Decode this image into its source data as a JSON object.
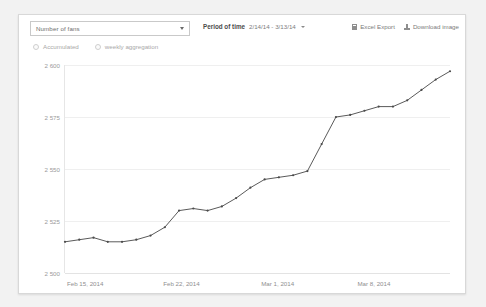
{
  "toolbar": {
    "metric_select": {
      "value": "Number of fans",
      "icon": "chevron-down-icon"
    },
    "period": {
      "label": "Period of time",
      "value": "2/14/14 - 3/13/14",
      "icon": "chevron-down-icon"
    },
    "excel_export": {
      "label": "Excel Export",
      "icon": "spreadsheet-icon"
    },
    "download_image": {
      "label": "Download image",
      "icon": "download-icon"
    }
  },
  "options": [
    {
      "label": "Accumulated",
      "selected": false,
      "icon": "radio-icon"
    },
    {
      "label": "weekly aggregation",
      "selected": false,
      "icon": "radio-icon"
    }
  ],
  "colors": {
    "line": "#5a5a5a",
    "marker": "#4a4a4a",
    "grid": "#efefef",
    "axis": "#e3e3e3",
    "card_bg": "#ffffff",
    "page_bg": "#f2f2f2",
    "text_muted": "#9a9a9a"
  },
  "chart_data": {
    "type": "line",
    "title": "",
    "xlabel": "",
    "ylabel": "",
    "grid": true,
    "legend": "none",
    "ylim": [
      2500,
      2600
    ],
    "yticks": [
      2500,
      2525,
      2550,
      2575,
      2600
    ],
    "ytick_labels": [
      "2 500",
      "2 525",
      "2 550",
      "2 575",
      "2 600"
    ],
    "xtick_labels": [
      "Feb 15, 2014",
      "Feb 22, 2014",
      "Mar 1, 2014",
      "Mar 8, 2014"
    ],
    "xtick_positions": [
      0.055,
      0.305,
      0.555,
      0.805
    ],
    "x": [
      "Feb 14, 2014",
      "Feb 15, 2014",
      "Feb 16, 2014",
      "Feb 17, 2014",
      "Feb 18, 2014",
      "Feb 19, 2014",
      "Feb 20, 2014",
      "Feb 21, 2014",
      "Feb 22, 2014",
      "Feb 23, 2014",
      "Feb 24, 2014",
      "Feb 25, 2014",
      "Feb 26, 2014",
      "Feb 27, 2014",
      "Feb 28, 2014",
      "Mar 1, 2014",
      "Mar 2, 2014",
      "Mar 3, 2014",
      "Mar 4, 2014",
      "Mar 5, 2014",
      "Mar 6, 2014",
      "Mar 7, 2014",
      "Mar 8, 2014",
      "Mar 9, 2014",
      "Mar 10, 2014",
      "Mar 11, 2014",
      "Mar 12, 2014",
      "Mar 13, 2014"
    ],
    "series": [
      {
        "name": "Number of fans",
        "values": [
          2515,
          2516,
          2517,
          2515,
          2515,
          2516,
          2518,
          2522,
          2530,
          2531,
          2530,
          2532,
          2536,
          2541,
          2545,
          2546,
          2547,
          2549,
          2562,
          2575,
          2576,
          2578,
          2580,
          2580,
          2583,
          2588,
          2593,
          2597
        ]
      }
    ]
  }
}
